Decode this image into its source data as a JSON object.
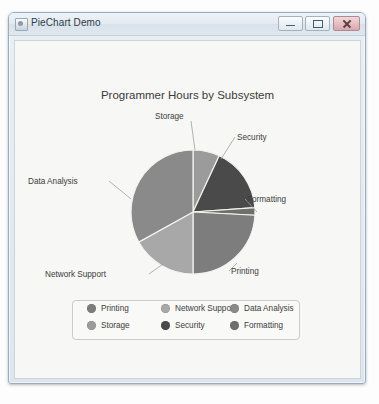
{
  "window": {
    "title": "PieChart Demo",
    "icon": "app-icon",
    "buttons": {
      "minimize": "Minimize",
      "maximize": "Maximize",
      "close": "Close"
    }
  },
  "chart_data": {
    "type": "pie",
    "title": "Programmer Hours by Subsystem",
    "xlabel": "",
    "ylabel": "",
    "legend_position": "bottom",
    "start_angle_deg": 0,
    "direction": "clockwise",
    "categories": [
      "Storage",
      "Security",
      "Formatting",
      "Printing",
      "Network Support",
      "Data Analysis"
    ],
    "values": [
      7,
      17,
      2,
      24,
      17,
      33
    ],
    "colors": [
      "#9b9b9b",
      "#4a4a4a",
      "#6f6f6f",
      "#7d7d7d",
      "#a8a8a8",
      "#8a8a8a"
    ],
    "slices": [
      {
        "label": "Storage",
        "value": 7,
        "color": "#9b9b9b",
        "start_deg": 0,
        "end_deg": 25
      },
      {
        "label": "Security",
        "value": 17,
        "color": "#4a4a4a",
        "start_deg": 25,
        "end_deg": 86
      },
      {
        "label": "Formatting",
        "value": 2,
        "color": "#6f6f6f",
        "start_deg": 86,
        "end_deg": 93
      },
      {
        "label": "Printing",
        "value": 24,
        "color": "#7d7d7d",
        "start_deg": 93,
        "end_deg": 180
      },
      {
        "label": "Network Support",
        "value": 17,
        "color": "#a8a8a8",
        "start_deg": 180,
        "end_deg": 241
      },
      {
        "label": "Data Analysis",
        "value": 33,
        "color": "#8a8a8a",
        "start_deg": 241,
        "end_deg": 360
      }
    ],
    "geometry": {
      "cx": 178,
      "cy": 171,
      "r": 62
    }
  },
  "callouts": [
    {
      "label": "Storage",
      "x": 140,
      "y": 71,
      "line": [
        176,
        80,
        180,
        109
      ]
    },
    {
      "label": "Security",
      "x": 222,
      "y": 92,
      "line": [
        220,
        96,
        206,
        118
      ]
    },
    {
      "label": "Formatting",
      "x": 232,
      "y": 154,
      "line": [
        230,
        158,
        242,
        171
      ]
    },
    {
      "label": "Printing",
      "x": 216,
      "y": 226,
      "line": [
        214,
        230,
        222,
        222
      ]
    },
    {
      "label": "Network Support",
      "x": 30,
      "y": 229,
      "line": [
        134,
        233,
        148,
        223
      ]
    },
    {
      "label": "Data Analysis",
      "x": 13,
      "y": 136,
      "line": [
        94,
        140,
        116,
        158
      ]
    }
  ],
  "legend": {
    "rows": [
      [
        {
          "label": "Printing",
          "color": "#7d7d7d",
          "x": 14
        },
        {
          "label": "Network Support",
          "color": "#a8a8a8",
          "x": 88
        },
        {
          "label": "Data Analysis",
          "color": "#8a8a8a",
          "x": 157
        }
      ],
      [
        {
          "label": "Storage",
          "color": "#9b9b9b",
          "x": 14
        },
        {
          "label": "Security",
          "color": "#4a4a4a",
          "x": 88
        },
        {
          "label": "Formatting",
          "color": "#6f6f6f",
          "x": 157
        }
      ]
    ]
  }
}
